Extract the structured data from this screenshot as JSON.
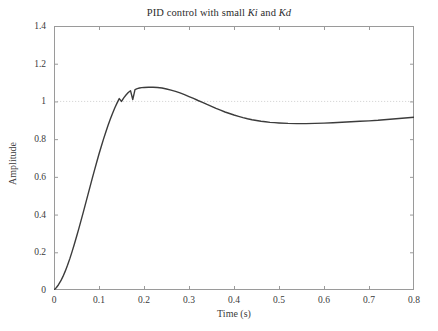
{
  "chart_data": {
    "type": "line",
    "title": "PID control with small Ki and Kd",
    "title_parts": {
      "lead": "PID control with small ",
      "sym1": "Ki",
      "mid": " and ",
      "sym2": "Kd"
    },
    "xlabel": "Time (s)",
    "ylabel": "Amplitude",
    "xlim": [
      0,
      0.8
    ],
    "ylim": [
      0,
      1.4
    ],
    "xticks": [
      0,
      0.1,
      0.2,
      0.3,
      0.4,
      0.5,
      0.6,
      0.7,
      0.8
    ],
    "xtick_labels": [
      "0",
      "0.1",
      "0.2",
      "0.3",
      "0.4",
      "0.5",
      "0.6",
      "0.7",
      "0.8"
    ],
    "yticks": [
      0,
      0.2,
      0.4,
      0.6,
      0.8,
      1,
      1.2,
      1.4
    ],
    "ytick_labels": [
      "0",
      "0.2",
      "0.4",
      "0.6",
      "0.8",
      "1",
      "1.2",
      "1.4"
    ],
    "grid": false,
    "legend": null,
    "reference_line": {
      "y": 1,
      "style": "dotted",
      "color": "#d8d8d8",
      "label": "setpoint"
    },
    "line_color": "#3c3c3c",
    "line_width": 1.4,
    "annotations": {
      "peak_value": 1.075,
      "peak_time": 0.225,
      "undershoot_value": 0.873,
      "undershoot_time": 0.45,
      "settling_value": 0.92,
      "rise_crossing_time": 0.175
    },
    "series": [
      {
        "name": "Step response",
        "x": [
          0,
          0.005,
          0.01,
          0.015,
          0.02,
          0.025,
          0.03,
          0.035,
          0.04,
          0.045,
          0.05,
          0.055,
          0.06,
          0.065,
          0.07,
          0.075,
          0.08,
          0.085,
          0.09,
          0.095,
          0.1,
          0.105,
          0.11,
          0.115,
          0.12,
          0.125,
          0.13,
          0.135,
          0.14,
          0.145,
          0.15,
          0.155,
          0.16,
          0.165,
          0.17,
          0.175,
          0.18,
          0.185,
          0.19,
          0.195,
          0.2,
          0.21,
          0.22,
          0.23,
          0.24,
          0.25,
          0.26,
          0.27,
          0.28,
          0.29,
          0.3,
          0.31,
          0.32,
          0.33,
          0.34,
          0.35,
          0.36,
          0.37,
          0.38,
          0.39,
          0.4,
          0.41,
          0.42,
          0.43,
          0.44,
          0.45,
          0.46,
          0.47,
          0.48,
          0.49,
          0.5,
          0.52,
          0.54,
          0.56,
          0.58,
          0.6,
          0.62,
          0.64,
          0.66,
          0.68,
          0.7,
          0.72,
          0.74,
          0.76,
          0.78,
          0.8
        ],
        "y": [
          0,
          0.012,
          0.028,
          0.048,
          0.072,
          0.1,
          0.131,
          0.165,
          0.202,
          0.241,
          0.282,
          0.324,
          0.368,
          0.412,
          0.457,
          0.502,
          0.547,
          0.592,
          0.636,
          0.679,
          0.721,
          0.761,
          0.8,
          0.837,
          0.872,
          0.905,
          0.936,
          0.965,
          0.991,
          1.015,
          1.0,
          1.019,
          1.034,
          1.047,
          1.057,
          1.01,
          1.063,
          1.068,
          1.071,
          1.073,
          1.074,
          1.0755,
          1.0755,
          1.074,
          1.071,
          1.066,
          1.06,
          1.053,
          1.045,
          1.036,
          1.026,
          1.016,
          1.005,
          0.995,
          0.984,
          0.974,
          0.963,
          0.954,
          0.944,
          0.936,
          0.928,
          0.921,
          0.914,
          0.908,
          0.903,
          0.899,
          0.895,
          0.892,
          0.889,
          0.8875,
          0.886,
          0.8835,
          0.8825,
          0.8825,
          0.8835,
          0.885,
          0.887,
          0.8895,
          0.892,
          0.8945,
          0.897,
          0.9,
          0.904,
          0.908,
          0.912,
          0.916
        ]
      }
    ]
  },
  "axes": {
    "frame_color": "#9a9a9a",
    "tick_color": "#9a9a9a"
  }
}
